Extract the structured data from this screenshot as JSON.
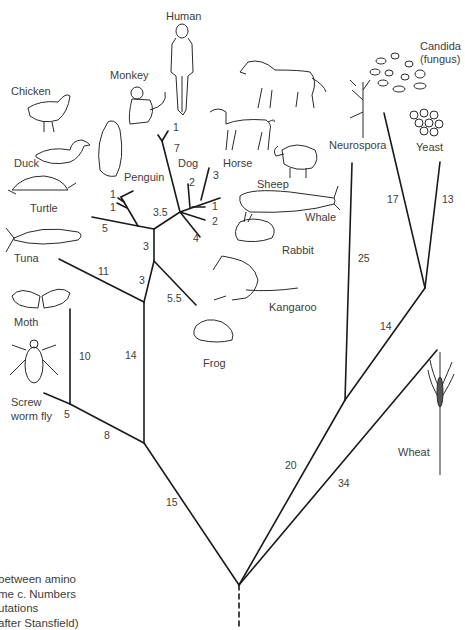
{
  "organisms": {
    "human": "Human",
    "monkey": "Monkey",
    "chicken": "Chicken",
    "duck": "Duck",
    "penguin": "Penguin",
    "turtle": "Turtle",
    "tuna": "Tuna",
    "moth": "Moth",
    "screw_worm_fly_1": "Screw",
    "screw_worm_fly_2": "worm fly",
    "dog": "Dog",
    "horse": "Horse",
    "sheep": "Sheep",
    "whale": "Whale",
    "rabbit": "Rabbit",
    "kangaroo": "Kangaroo",
    "frog": "Frog",
    "neurospora": "Neurospora",
    "candida_1": "Candida",
    "candida_2": "(fungus)",
    "yeast": "Yeast",
    "wheat": "Wheat"
  },
  "branch_numbers": {
    "human_monkey_tip": "1",
    "primate_stem": "7",
    "chicken": "1",
    "duck": "1",
    "turtle": "5",
    "bird_mammal": "3.5",
    "dog": "2",
    "horse": "3",
    "sheep": "1",
    "whale_rabbit": "2",
    "kangaroo": "4",
    "reptile_stem": "3",
    "frog_stem": "3",
    "frog": "5.5",
    "tuna": "11",
    "vertebrate_stem": "14",
    "moth": "10",
    "screw_worm_fly": "5",
    "insect_stem": "8",
    "animal_stem": "15",
    "neurospora": "25",
    "candida": "17",
    "yeast": "13",
    "fungi_stem": "14",
    "fungal_root": "20",
    "wheat": "34"
  },
  "caption": {
    "line1": " between amino",
    "line2": "me c. Numbers",
    "line3": "utations",
    "line4": "after Stansfield)"
  }
}
